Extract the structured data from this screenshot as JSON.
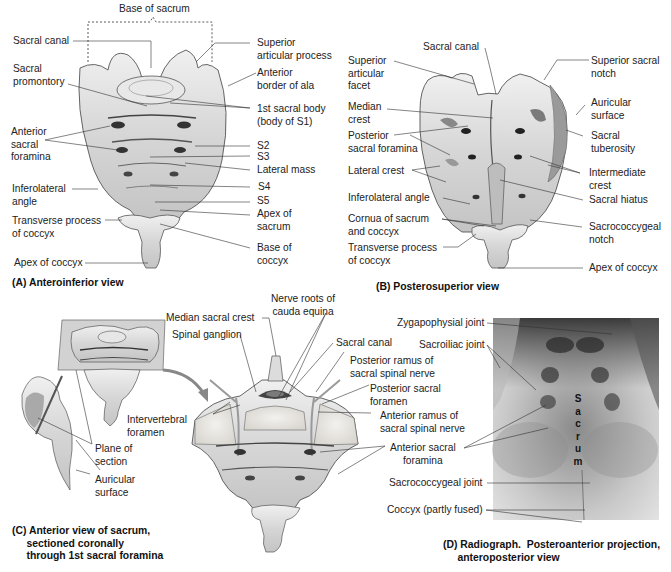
{
  "figure": {
    "panels": {
      "A": {
        "caption": "(A) Anteroinferior view",
        "bracket_label": "Base of sacrum",
        "labels_left": {
          "sacral_canal": "Sacral canal",
          "sacral_promontory": "Sacral\npromontory",
          "anterior_sacral_foramina": "Anterior\nsacral\nforamina",
          "inferolateral_angle": "Inferolateral\nangle",
          "transverse_process_coccyx": "Transverse process\nof coccyx",
          "apex_of_coccyx": "Apex of coccyx"
        },
        "labels_right": {
          "superior_articular_process": "Superior\narticular process",
          "anterior_border_of_ala": "Anterior\nborder of ala",
          "first_sacral_body": "1st sacral body\n(body of S1)",
          "s2": "S2",
          "s3": "S3",
          "lateral_mass": "Lateral mass",
          "s4": "S4",
          "s5": "S5",
          "apex_of_sacrum": "Apex of\nsacrum",
          "base_of_coccyx": "Base of\ncoccyx"
        }
      },
      "B": {
        "caption": "(B) Posterosuperior view",
        "labels_left": {
          "superior_articular_facet": "Superior\narticular\nfacet",
          "median_crest": "Median\ncrest",
          "posterior_sacral_foramina": "Posterior\nsacral foramina",
          "lateral_crest": "Lateral crest",
          "inferolateral_angle": "Inferolateral angle",
          "cornua": "Cornua of sacrum\nand coccyx",
          "transverse_process_coccyx": "Transverse process\nof coccyx"
        },
        "labels_top": {
          "sacral_canal": "Sacral canal"
        },
        "labels_right": {
          "superior_sacral_notch": "Superior sacral\nnotch",
          "auricular_surface": "Auricular\nsurface",
          "sacral_tuberosity": "Sacral\ntuberosity",
          "intermediate_crest": "Intermediate\ncrest",
          "sacral_hiatus": "Sacral hiatus",
          "sacrococcygeal_notch": "Sacrococcygeal\nnotch",
          "apex_of_coccyx": "Apex of coccyx"
        }
      },
      "C": {
        "caption": "(C) Anterior view of sacrum,\n     sectioned coronally\n     through 1st sacral foramina",
        "labels": {
          "median_sacral_crest": "Median sacral crest",
          "nerve_roots": "Nerve roots of\ncauda equina",
          "spinal_ganglion": "Spinal ganglion",
          "sacral_canal": "Sacral canal",
          "posterior_ramus": "Posterior ramus of\nsacral spinal nerve",
          "posterior_sacral_foramen": "Posterior sacral\nforamen",
          "anterior_ramus": "Anterior ramus of\nsacral spinal nerve",
          "intervertebral_foramen": "Intervertebral\nforamen",
          "plane_of_section": "Plane of\nsection",
          "auricular_surface": "Auricular\nsurface",
          "anterior_sacral_foramina": "Anterior sacral\nforamina"
        }
      },
      "D": {
        "caption": "(D) Radiograph.  Posteroanterior projection,\n     anteroposterior view",
        "overlay_text": [
          "S",
          "a",
          "c",
          "r",
          "u",
          "m"
        ],
        "labels": {
          "zygapophysial_joint": "Zygapophysial joint",
          "sacroiliac_joint": "Sacroiliac joint",
          "sacrococcygeal_joint": "Sacrococcygeal joint",
          "coccyx": "Coccyx (partly fused)"
        }
      }
    },
    "colors": {
      "bone_fill": "#dcdcdc",
      "bone_shadow": "#9a9a9a",
      "leader_line": "#333333",
      "radiograph_dark": "#2a2a2a",
      "radiograph_light": "#e8e8e8",
      "nerve": "#b5b5b5"
    }
  }
}
